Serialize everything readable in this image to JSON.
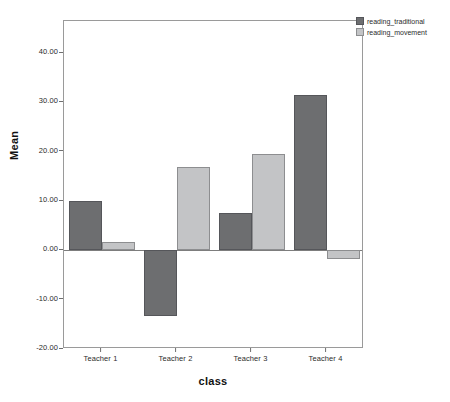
{
  "chart_data": {
    "type": "bar",
    "title": "",
    "xlabel": "class",
    "ylabel": "Mean",
    "categories": [
      "Teacher 1",
      "Teacher 2",
      "Teacher 3",
      "Teacher 4"
    ],
    "series": [
      {
        "name": "reading_traditional",
        "color": "#6d6e70",
        "values": [
          10.0,
          -13.3,
          7.6,
          31.4
        ]
      },
      {
        "name": "reading_movement",
        "color": "#c3c4c6",
        "values": [
          1.6,
          16.8,
          19.6,
          -1.8
        ]
      }
    ],
    "ylim": [
      -20.0,
      46.5
    ],
    "yticks": [
      40.0,
      30.0,
      20.0,
      10.0,
      0.0,
      -10.0,
      -20.0
    ],
    "ytick_labels": [
      "40.00",
      "30.00",
      "20.00",
      "10.00",
      "0.00",
      "-10.00",
      "-20.00"
    ],
    "grid": false,
    "legend_position": "top-right",
    "zero_line": 0.0
  },
  "axes": {
    "y_title": "Mean",
    "x_title": "class"
  },
  "legend": {
    "items": [
      {
        "label": "reading_traditional",
        "swatch": "legend-swatch-dark"
      },
      {
        "label": "reading_movement",
        "swatch": "legend-swatch-light"
      }
    ]
  }
}
